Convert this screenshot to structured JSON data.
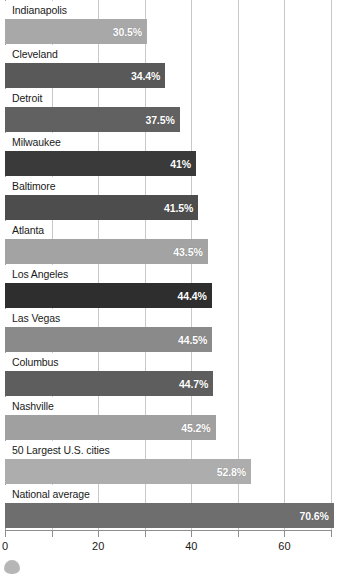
{
  "chart_data": {
    "type": "bar",
    "orientation": "horizontal",
    "title": "",
    "xlabel": "",
    "ylabel": "",
    "xlim": [
      0,
      70.2
    ],
    "grid": true,
    "legend": null,
    "value_suffix": "%",
    "xticks": [
      {
        "value": 0,
        "label": "0",
        "major": true
      },
      {
        "value": 10,
        "label": "",
        "major": false
      },
      {
        "value": 20,
        "label": "20",
        "major": true
      },
      {
        "value": 30,
        "label": "",
        "major": false
      },
      {
        "value": 40,
        "label": "40",
        "major": true
      },
      {
        "value": 50,
        "label": "",
        "major": false
      },
      {
        "value": 60,
        "label": "60",
        "major": true
      },
      {
        "value": 70,
        "label": "",
        "major": false
      }
    ],
    "gridlines": [
      0,
      10,
      20,
      30,
      40,
      50,
      60,
      70
    ],
    "categories": [
      "Indianapolis",
      "Cleveland",
      "Detroit",
      "Milwaukee",
      "Baltimore",
      "Atlanta",
      "Los Angeles",
      "Las Vegas",
      "Columbus",
      "Nashville",
      "50 Largest U.S. cities",
      "National average"
    ],
    "values": [
      30.5,
      34.4,
      37.5,
      41,
      41.5,
      43.5,
      44.4,
      44.5,
      44.7,
      45.2,
      52.8,
      70.6
    ],
    "data_labels": [
      "30.5%",
      "34.4%",
      "37.5%",
      "41%",
      "41.5%",
      "43.5%",
      "44.4%",
      "44.5%",
      "44.7%",
      "45.2%",
      "52.8%",
      "70.6%"
    ],
    "bar_colors": [
      "#a8a8a8",
      "#595959",
      "#616161",
      "#3a3a3a",
      "#4d4d4d",
      "#a3a3a3",
      "#2e2e2e",
      "#8a8a8a",
      "#5e5e5e",
      "#a0a0a0",
      "#adadad",
      "#6e6e6e"
    ],
    "gridline_color": "#c9c9c9",
    "axis_color": "#8e8e8e",
    "label_text_color": "#1a1a1a",
    "value_text_color": "#ffffff",
    "background_color": "#ffffff"
  }
}
